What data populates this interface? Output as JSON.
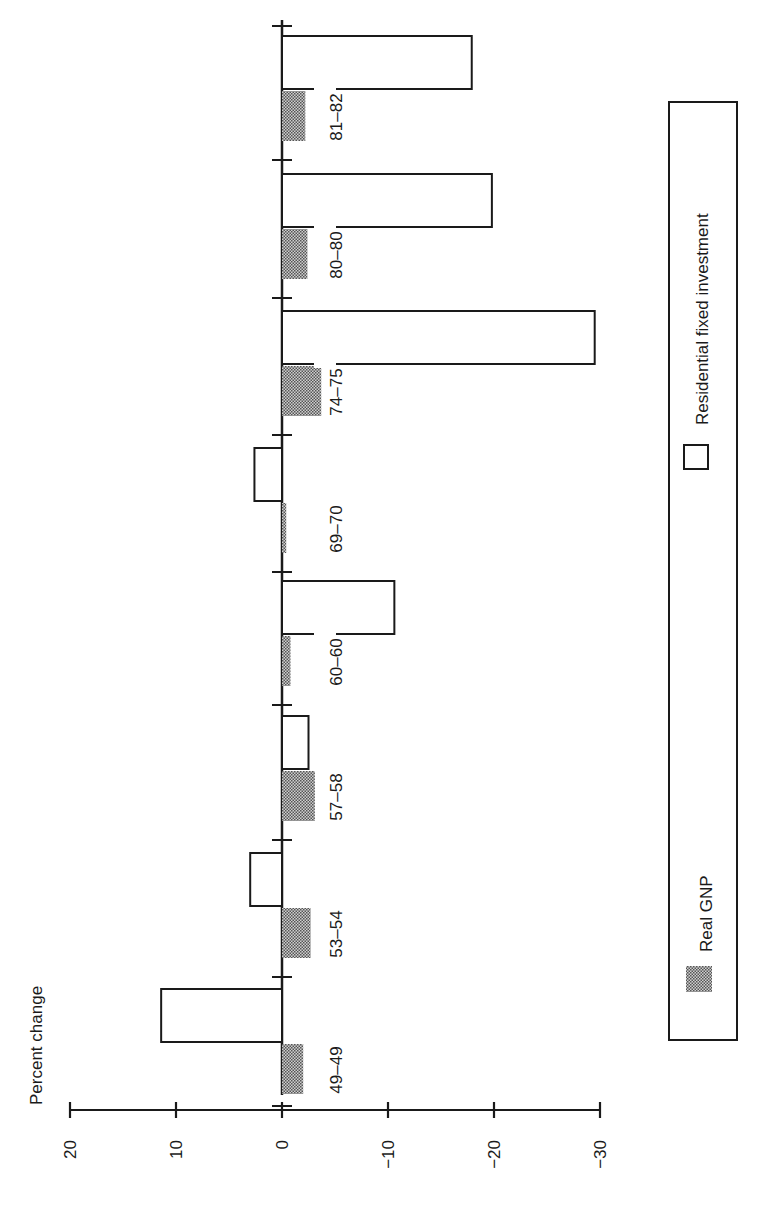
{
  "chart_data": {
    "type": "bar",
    "orientation": "rotated-90-ccw",
    "title": "",
    "ylabel": "Percent change",
    "xlabel": "",
    "ylim": [
      -30,
      20
    ],
    "yticks": [
      20,
      10,
      0,
      -10,
      -20,
      -30
    ],
    "ytick_labels": [
      "20",
      "10",
      "0",
      "−10",
      "−20",
      "−30"
    ],
    "categories": [
      "49–49",
      "53–54",
      "57–58",
      "60–60",
      "69–70",
      "74–75",
      "80–80",
      "81–82"
    ],
    "series": [
      {
        "name": "Residential fixed investment",
        "fill": "white",
        "values": [
          11.4,
          3.0,
          -2.5,
          -10.6,
          2.6,
          -29.5,
          -19.8,
          -17.9
        ]
      },
      {
        "name": "Real GNP",
        "fill": "shaded",
        "values": [
          -2.0,
          -2.7,
          -3.1,
          -0.8,
          -0.4,
          -3.7,
          -2.4,
          -2.2
        ]
      }
    ],
    "legend": {
      "position": "right",
      "entries": [
        {
          "label": "Real GNP",
          "swatch": "shaded"
        },
        {
          "label": "Residential fixed investment",
          "swatch": "white"
        }
      ]
    },
    "grid": false
  },
  "colors": {
    "ink": "#1a1a1a",
    "shade": "#8c8c8c",
    "background": "#ffffff"
  }
}
